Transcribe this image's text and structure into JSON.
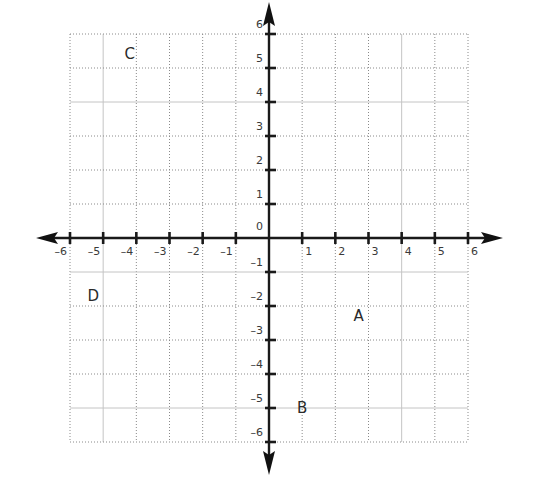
{
  "figure": {
    "type": "coordinate-plane",
    "x_range": [
      -6,
      6
    ],
    "y_range": [
      -6,
      6
    ],
    "x_ticks": [
      -6,
      -5,
      -4,
      -3,
      -2,
      -1,
      1,
      2,
      3,
      4,
      5,
      6
    ],
    "y_ticks": [
      -6,
      -5,
      -4,
      -3,
      -2,
      -1,
      1,
      2,
      3,
      4,
      5,
      6
    ],
    "origin_label": "0",
    "minus_sign": "–",
    "points": [
      {
        "label": "A",
        "x": 2.7,
        "y": -2.3
      },
      {
        "label": "B",
        "x": 1.0,
        "y": -5.0
      },
      {
        "label": "C",
        "x": -4.2,
        "y": 5.4
      },
      {
        "label": "D",
        "x": -5.3,
        "y": -1.7
      }
    ],
    "colors": {
      "axis": "#1a1a1a",
      "grid": "#8a8a8a",
      "text": "#3a3a3a",
      "background": "#ffffff"
    }
  },
  "layout": {
    "grid_left": 70,
    "grid_right": 468,
    "grid_top": 34,
    "grid_bottom": 442,
    "arrow_left": 36,
    "arrow_right": 503,
    "arrow_top": 2,
    "arrow_bottom": 475
  }
}
